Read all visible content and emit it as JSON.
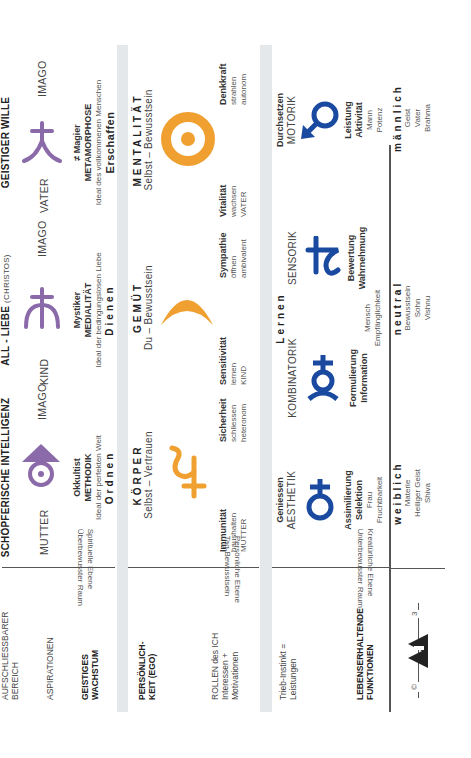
{
  "colors": {
    "purple": "#8a6aa8",
    "orange": "#f0a030",
    "blue": "#1a4aa0",
    "separator": "#e4e8ea"
  },
  "left_column": {
    "row1": {
      "title_line1": "AUFSCHLIESSBARER",
      "title_line2": "BEREICH",
      "aspirations": "ASPIRATIONEN",
      "growth_line1": "GEISTIGES",
      "growth_line2": "WACHSTUM",
      "level_line1": "Spirituelle Ebene",
      "level_line2": "Überbewusster Raum"
    },
    "row2": {
      "title_line1": "PERSÖNLICH-",
      "title_line2": "KEIT (EGO)",
      "roles_line1": "ROLLEN des ICH",
      "roles_line2": "Interessen +",
      "roles_line3": "Motivationen",
      "level_line1": "Persönliche Ebene",
      "level_line2": "Tag-Bewusstsein"
    },
    "row3": {
      "instinct_line1": "Trieb-Instinkt =",
      "instinct_line2": "Leistungen",
      "title_line1": "LEBENSERHALTENDE",
      "title_line2": "FUNKTIONEN",
      "level_line1": "Kreatürliche Ebene",
      "level_line2": "Unterbewusster Raum"
    },
    "logo": {
      "copyright": "©",
      "mark": "APA",
      "page_number": "3"
    }
  },
  "row1": {
    "columns": [
      {
        "header": "SCHÖPFERISCHE INTELLIGENZ",
        "header_sub": "",
        "left_label": "MUTTER",
        "right_label": "IMAGO",
        "symbol": "pluto-symbol",
        "type": "Okkultist",
        "mode": "METHODIK",
        "ideal": "Ideal der perfekten Welt",
        "verb": "Ordnen"
      },
      {
        "header": "ALL - LIEBE",
        "header_sub": "(CHRISTOS)",
        "left_label": "KIND",
        "right_label": "IMAGO",
        "symbol": "neptune-symbol",
        "type": "Mystiker",
        "mode": "MEDIALITÄT",
        "ideal": "Ideal der bedingungslosen Liebe",
        "verb": "Dienen"
      },
      {
        "header": "GEISTIGER WILLE",
        "header_sub": "",
        "left_label": "VATER",
        "right_label": "IMAGO",
        "symbol": "uranus-symbol",
        "type": "≠ Magier",
        "mode": "METAMORPHOSE",
        "ideal": "Ideal des vollkommenen Menschen",
        "verb": "Erschaffen"
      }
    ]
  },
  "row2": {
    "groups": [
      {
        "title": "KÖRPER",
        "subtitle": "Selbst – Vertrauen",
        "symbol": "saturn-symbol",
        "left": {
          "title": "Immunität",
          "line2": "haushalten",
          "line3": "MUTTER"
        },
        "right": {
          "title": "Sicherheit",
          "line2": "schliessen",
          "line3": "heteronom"
        }
      },
      {
        "title": "GEMÜT",
        "subtitle": "Du – Bewusstsein",
        "symbol": "moon-symbol",
        "left": {
          "title": "Sensitivität",
          "line2": "lernen",
          "line3": "KIND"
        },
        "right": {
          "title": "Sympathie",
          "line2": "öffnen",
          "line3": "ambivalent"
        }
      },
      {
        "title": "MENTALITÄT",
        "subtitle": "Selbst – Bewusstsein",
        "symbol": "sun-symbol",
        "left": {
          "title": "Vitalität",
          "line2": "wachsen",
          "line3": "VATER"
        },
        "right": {
          "title": "Denkkraft",
          "line2": "strahlen",
          "line3": "autonom"
        }
      }
    ]
  },
  "row3": {
    "items": [
      {
        "top1": "Geniessen",
        "top2": "AESTHETIK",
        "symbol": "venus-symbol",
        "b1": "Assimilierung",
        "b2": "Selektion",
        "n1": "Frau",
        "n2": "Fruchtbarkeit"
      },
      {
        "top1": "",
        "top2": "KOMBINATORIK",
        "symbol": "mercury-symbol",
        "b1": "Formulierung",
        "b2": "Information",
        "n1": "",
        "n2": ""
      },
      {
        "top1": "",
        "top2": "SENSORIK",
        "symbol": "jupiter-symbol",
        "b1": "Bewertung",
        "b2": "Wahrnehmung",
        "n1": "",
        "n2": ""
      },
      {
        "top1": "Durchsetzen",
        "top2": "MOTORIK",
        "symbol": "mars-symbol",
        "b1": "Leistung",
        "b2": "Aktivität",
        "n1": "Mann",
        "n2": "Potenz"
      }
    ],
    "center": {
      "title": "Lernen",
      "n1": "Mensch",
      "n2": "Empfänglichkeit"
    }
  },
  "row4": {
    "items": [
      {
        "title": "weiblich",
        "l1": "Materie",
        "l2": "Heiliger Geist",
        "l3": "Shiva"
      },
      {
        "title": "neutral",
        "l1": "Bewusstsein",
        "l2": "Sohn",
        "l3": "Vishnu"
      },
      {
        "title": "männlich",
        "l1": "Geist",
        "l2": "Vater",
        "l3": "Brahma"
      }
    ]
  }
}
